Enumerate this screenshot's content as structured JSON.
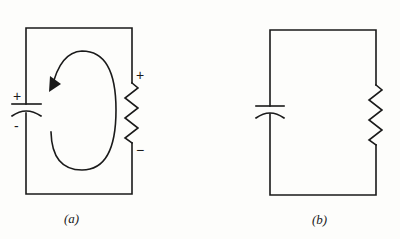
{
  "figures": [
    {
      "id": "a",
      "caption": "(a)",
      "capacitor": {
        "plus_label": "+",
        "minus_label": "-"
      },
      "resistor": {
        "plus_label": "+",
        "minus_label": "−"
      },
      "loop_arrow": "counterclockwise"
    },
    {
      "id": "b",
      "caption": "(b)"
    }
  ],
  "colors": {
    "ink": "#1a1a1a",
    "background": "#fdfdfb"
  }
}
